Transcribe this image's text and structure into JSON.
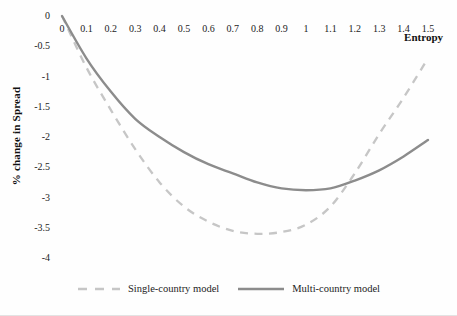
{
  "chart_data": {
    "type": "line",
    "title": "",
    "xlabel": "Entropy",
    "ylabel": "% change in Spread",
    "xlim": [
      0,
      1.5
    ],
    "ylim": [
      -4,
      0
    ],
    "grid": false,
    "legend_position": "bottom",
    "x_ticks": [
      "0",
      "0.1",
      "0.2",
      "0.3",
      "0.4",
      "0.5",
      "0.6",
      "0.7",
      "0.8",
      "0.9",
      "1",
      "1.1",
      "1.2",
      "1.3",
      "1.4",
      "1.5"
    ],
    "x_tick_values": [
      0,
      0.1,
      0.2,
      0.3,
      0.4,
      0.5,
      0.6,
      0.7,
      0.8,
      0.9,
      1.0,
      1.1,
      1.2,
      1.3,
      1.4,
      1.5
    ],
    "y_ticks": [
      "0",
      "-0.5",
      "-1",
      "-1.5",
      "-2",
      "-2.5",
      "-3",
      "-3.5",
      "-4"
    ],
    "y_tick_values": [
      0,
      -0.5,
      -1,
      -1.5,
      -2,
      -2.5,
      -3,
      -3.5,
      -4
    ],
    "x": [
      0,
      0.1,
      0.2,
      0.3,
      0.4,
      0.5,
      0.6,
      0.7,
      0.8,
      0.9,
      1.0,
      1.1,
      1.2,
      1.3,
      1.4,
      1.5
    ],
    "series": [
      {
        "name": "Single-country model",
        "style": "dashed",
        "color": "#c6c6c6",
        "values": [
          0,
          -0.85,
          -1.55,
          -2.2,
          -2.75,
          -3.15,
          -3.4,
          -3.55,
          -3.6,
          -3.57,
          -3.45,
          -3.15,
          -2.6,
          -1.95,
          -1.35,
          -0.7
        ]
      },
      {
        "name": "Multi-country model",
        "style": "solid",
        "color": "#8c8c8c",
        "values": [
          0,
          -0.7,
          -1.25,
          -1.7,
          -2.0,
          -2.25,
          -2.45,
          -2.6,
          -2.75,
          -2.85,
          -2.88,
          -2.85,
          -2.72,
          -2.55,
          -2.32,
          -2.05
        ]
      }
    ]
  },
  "layout_text": {
    "entropy_label": "Entropy",
    "spread_label": "% change in Spread"
  }
}
